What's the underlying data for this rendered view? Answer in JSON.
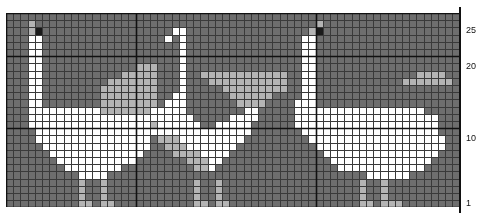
{
  "chart_data": {
    "type": "heatmap",
    "xlabel": "",
    "ylabel": "",
    "grid": true,
    "legend_position": "none",
    "columns": 63,
    "rows": 27,
    "cell_px": 7.2,
    "origin": {
      "x": 6,
      "y": 13
    },
    "heavy_every": 10,
    "heavy_columns": [
      0,
      18,
      43,
      63
    ],
    "heavy_rows": [
      0,
      6,
      16,
      27
    ],
    "row_labels": [
      {
        "value": "25",
        "row": 2
      },
      {
        "value": "20",
        "row": 7
      },
      {
        "value": "10",
        "row": 17
      },
      {
        "value": "1",
        "row": 26
      }
    ],
    "palette": {
      "0": "#6e6e6e",
      "1": "#ffffff",
      "2": "#b4b4b4",
      "3": "#1a1a1a"
    },
    "color_names": {
      "0": "background-grey",
      "1": "white",
      "2": "light-grey",
      "3": "black-beak"
    },
    "axis_color": "#111111",
    "grid_line_color": "#3a3a3a",
    "heavy_line_color": "#111111",
    "cells": [
      "000000000000000000000000000000000000000000000000000000000000000",
      "000200000000000000000000000000000000000000020000000000000000000",
      "000230000000000000000001100000000000000000230000000000000000000",
      "000110000000000000000010100000000000000001100000000000000000000",
      "000110000000000000000000100000000000000001100000000000000000000",
      "000110000000000000000000100000000000000001100000000000000000000",
      "000110000000000000000000100000000000000001100000000000000000000",
      "000110000000000000222000100000000000000001100000000000000000000",
      "000110000000000022222000100222222222222001100000000000000222200",
      "000110000000002222222000100022222222222001100000000000022222220",
      "000110000000022222222000100000222222222001100000000000000000000",
      "000110000000022222222001100000022222200001100000000000000000000",
      "000110000000022222222011100000002222000011100000000000000000000",
      "000111111111122222221111100000000110000011111111111111111100000",
      "000111111111111111111111110000011110000011111111111111111111000",
      "000111111111111111112111111001111100000011111111111111111111000",
      "000011111111111111111111111111111100000001111111111111111111000",
      "000011111111111111110222111111111000000000111111111111111111100",
      "000001111111111111110022211111110000000000011111111111111111100",
      "000000111111111111100002222111100000000000001111111111111111000",
      "000000011111111111000000022211000000000000000111111111111110000",
      "000000001111111100000000002210000000000000000011111111111100000",
      "000000000011110000000000000000000000000000000000001111110000000",
      "000000000020020000000000002002000000000000000000020020000000000",
      "000000000020020000000000002002000000000000000000020020000000000",
      "000000000020020000000000002002000000000000000000020020000000000",
      "000000000022022000000000002202200000000000000000022022200000000"
    ]
  }
}
